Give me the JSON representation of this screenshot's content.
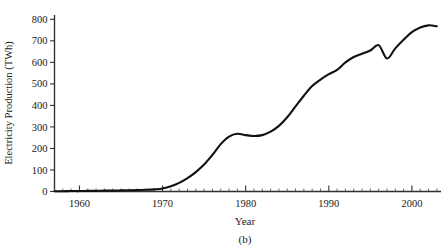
{
  "figure": {
    "panel_label": "(b)",
    "background_color": "#ffffff",
    "line_color": "#111111",
    "axis_color": "#333333"
  },
  "chart_data": {
    "type": "line",
    "title": "",
    "subtitle": "",
    "xlabel": "Year",
    "ylabel": "Electricity Production (TWh)",
    "xlim": [
      1957,
      2003.5
    ],
    "ylim": [
      0,
      820
    ],
    "xticks": [
      1960,
      1970,
      1980,
      1990,
      2000
    ],
    "xtick_labels": [
      "1960",
      "1970",
      "1980",
      "1990",
      "2000"
    ],
    "x_minor_tick_step": 1,
    "yticks": [
      0,
      100,
      200,
      300,
      400,
      500,
      600,
      700,
      800
    ],
    "ytick_labels": [
      "0",
      "100",
      "200",
      "300",
      "400",
      "500",
      "600",
      "700",
      "800"
    ],
    "grid": false,
    "legend": null,
    "legend_position": "none",
    "annotations": [],
    "series": [
      {
        "name": "Electricity Production",
        "x": [
          1957,
          1958,
          1959,
          1960,
          1961,
          1962,
          1963,
          1964,
          1965,
          1966,
          1967,
          1968,
          1969,
          1970,
          1971,
          1972,
          1973,
          1974,
          1975,
          1976,
          1977,
          1978,
          1979,
          1980,
          1981,
          1982,
          1983,
          1984,
          1985,
          1986,
          1987,
          1988,
          1989,
          1990,
          1991,
          1992,
          1993,
          1994,
          1995,
          1996,
          1997,
          1998,
          1999,
          2000,
          2001,
          2002,
          2003
        ],
        "values": [
          1,
          1,
          2,
          2,
          3,
          3,
          4,
          4,
          5,
          6,
          7,
          8,
          10,
          14,
          24,
          40,
          62,
          90,
          125,
          170,
          220,
          255,
          268,
          262,
          258,
          262,
          278,
          305,
          345,
          395,
          445,
          490,
          520,
          545,
          565,
          600,
          625,
          640,
          655,
          680,
          618,
          665,
          705,
          740,
          762,
          772,
          768
        ]
      }
    ]
  }
}
